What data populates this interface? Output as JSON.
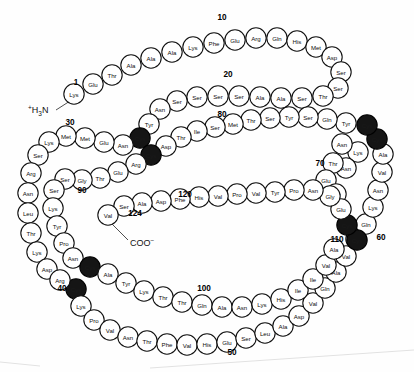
{
  "figure": {
    "type": "protein-sequence-diagram",
    "background_color": "#fefefe",
    "residue_fill": "#ffffff",
    "residue_stroke": "#111111",
    "cysteine_fill": "#151515",
    "n_terminus_label": "H3N",
    "n_terminus_superscript": "+",
    "n_terminus_subscript": "3",
    "c_terminus_label": "COO",
    "c_terminus_superscript": "-",
    "total_residues": 124
  },
  "number_markers": [
    {
      "n": "1",
      "x": 76,
      "y": 82
    },
    {
      "n": "10",
      "x": 222,
      "y": 17
    },
    {
      "n": "20",
      "x": 228,
      "y": 74
    },
    {
      "n": "30",
      "x": 70,
      "y": 122
    },
    {
      "n": "40",
      "x": 62,
      "y": 288
    },
    {
      "n": "50",
      "x": 232,
      "y": 352
    },
    {
      "n": "60",
      "x": 381,
      "y": 237
    },
    {
      "n": "70",
      "x": 320,
      "y": 163
    },
    {
      "n": "80",
      "x": 222,
      "y": 114
    },
    {
      "n": "90",
      "x": 82,
      "y": 190
    },
    {
      "n": "100",
      "x": 204,
      "y": 288
    },
    {
      "n": "110",
      "x": 337,
      "y": 239
    },
    {
      "n": "120",
      "x": 185,
      "y": 194
    },
    {
      "n": "124",
      "x": 135,
      "y": 213
    }
  ],
  "sequence": [
    {
      "i": 1,
      "aa": "Lys",
      "cys": false,
      "x": 74,
      "y": 94
    },
    {
      "i": 2,
      "aa": "Glu",
      "cys": false,
      "x": 93,
      "y": 84
    },
    {
      "i": 3,
      "aa": "Thr",
      "cys": false,
      "x": 112,
      "y": 75
    },
    {
      "i": 4,
      "aa": "Ala",
      "cys": false,
      "x": 131,
      "y": 65
    },
    {
      "i": 5,
      "aa": "Ala",
      "cys": false,
      "x": 151,
      "y": 58
    },
    {
      "i": 6,
      "aa": "Ala",
      "cys": false,
      "x": 172,
      "y": 52
    },
    {
      "i": 7,
      "aa": "Lys",
      "cys": false,
      "x": 193,
      "y": 47
    },
    {
      "i": 8,
      "aa": "Phe",
      "cys": false,
      "x": 214,
      "y": 43
    },
    {
      "i": 9,
      "aa": "Glu",
      "cys": false,
      "x": 235,
      "y": 40
    },
    {
      "i": 10,
      "aa": "Arg",
      "cys": false,
      "x": 256,
      "y": 38
    },
    {
      "i": 11,
      "aa": "Gln",
      "cys": false,
      "x": 277,
      "y": 38
    },
    {
      "i": 12,
      "aa": "His",
      "cys": false,
      "x": 297,
      "y": 41
    },
    {
      "i": 13,
      "aa": "Met",
      "cys": false,
      "x": 316,
      "y": 47
    },
    {
      "i": 14,
      "aa": "Asp",
      "cys": false,
      "x": 332,
      "y": 57
    },
    {
      "i": 15,
      "aa": "Ser",
      "cys": false,
      "x": 341,
      "y": 72
    },
    {
      "i": 16,
      "aa": "Ser",
      "cys": false,
      "x": 338,
      "y": 88
    },
    {
      "i": 17,
      "aa": "Thr",
      "cys": false,
      "x": 323,
      "y": 96
    },
    {
      "i": 18,
      "aa": "Ser",
      "cys": false,
      "x": 302,
      "y": 98
    },
    {
      "i": 19,
      "aa": "Ala",
      "cys": false,
      "x": 281,
      "y": 98
    },
    {
      "i": 20,
      "aa": "Ala",
      "cys": false,
      "x": 260,
      "y": 97
    },
    {
      "i": 21,
      "aa": "Ser",
      "cys": false,
      "x": 239,
      "y": 96
    },
    {
      "i": 22,
      "aa": "Ser",
      "cys": false,
      "x": 218,
      "y": 96
    },
    {
      "i": 23,
      "aa": "Ser",
      "cys": false,
      "x": 197,
      "y": 97
    },
    {
      "i": 24,
      "aa": "Ser",
      "cys": false,
      "x": 177,
      "y": 101
    },
    {
      "i": 25,
      "aa": "Asn",
      "cys": false,
      "x": 160,
      "y": 109
    },
    {
      "i": 26,
      "aa": "Tyr",
      "cys": false,
      "x": 149,
      "y": 124
    },
    {
      "i": 27,
      "aa": "Cys",
      "cys": true,
      "x": 140,
      "y": 138
    },
    {
      "i": 28,
      "aa": "Asn",
      "cys": false,
      "x": 123,
      "y": 145
    },
    {
      "i": 29,
      "aa": "Glu",
      "cys": false,
      "x": 104,
      "y": 142
    },
    {
      "i": 30,
      "aa": "Met",
      "cys": false,
      "x": 85,
      "y": 138
    },
    {
      "i": 31,
      "aa": "Met",
      "cys": false,
      "x": 66,
      "y": 136
    },
    {
      "i": 32,
      "aa": "Lys",
      "cys": false,
      "x": 49,
      "y": 142
    },
    {
      "i": 33,
      "aa": "Ser",
      "cys": false,
      "x": 38,
      "y": 155
    },
    {
      "i": 34,
      "aa": "Arg",
      "cys": false,
      "x": 31,
      "y": 173
    },
    {
      "i": 35,
      "aa": "Asn",
      "cys": false,
      "x": 28,
      "y": 193
    },
    {
      "i": 36,
      "aa": "Leu",
      "cys": false,
      "x": 28,
      "y": 213
    },
    {
      "i": 37,
      "aa": "Thr",
      "cys": false,
      "x": 31,
      "y": 233
    },
    {
      "i": 38,
      "aa": "Lys",
      "cys": false,
      "x": 37,
      "y": 252
    },
    {
      "i": 39,
      "aa": "Asp",
      "cys": false,
      "x": 47,
      "y": 269
    },
    {
      "i": 40,
      "aa": "Cys",
      "cys": true,
      "x": 76,
      "y": 289
    },
    {
      "i": 41,
      "aa": "Arg",
      "cys": false,
      "x": 60,
      "y": 280
    },
    {
      "i": 42,
      "aa": "Lys",
      "cys": false,
      "x": 81,
      "y": 306
    },
    {
      "i": 43,
      "aa": "Pro",
      "cys": false,
      "x": 94,
      "y": 320
    },
    {
      "i": 44,
      "aa": "Val",
      "cys": false,
      "x": 110,
      "y": 330
    },
    {
      "i": 45,
      "aa": "Asn",
      "cys": false,
      "x": 128,
      "y": 337
    },
    {
      "i": 46,
      "aa": "Thr",
      "cys": false,
      "x": 147,
      "y": 341
    },
    {
      "i": 47,
      "aa": "Phe",
      "cys": false,
      "x": 167,
      "y": 344
    },
    {
      "i": 48,
      "aa": "Val",
      "cys": false,
      "x": 187,
      "y": 345
    },
    {
      "i": 49,
      "aa": "His",
      "cys": false,
      "x": 207,
      "y": 344
    },
    {
      "i": 50,
      "aa": "Glu",
      "cys": false,
      "x": 227,
      "y": 342
    },
    {
      "i": 51,
      "aa": "Ser",
      "cys": false,
      "x": 246,
      "y": 338
    },
    {
      "i": 52,
      "aa": "Leu",
      "cys": false,
      "x": 265,
      "y": 333
    },
    {
      "i": 53,
      "aa": "Ala",
      "cys": false,
      "x": 283,
      "y": 326
    },
    {
      "i": 54,
      "aa": "Asp",
      "cys": false,
      "x": 299,
      "y": 316
    },
    {
      "i": 55,
      "aa": "Val",
      "cys": false,
      "x": 313,
      "y": 303
    },
    {
      "i": 56,
      "aa": "Gln",
      "cys": false,
      "x": 325,
      "y": 288
    },
    {
      "i": 57,
      "aa": "Ala",
      "cys": false,
      "x": 336,
      "y": 272
    },
    {
      "i": 58,
      "aa": "Val",
      "cys": false,
      "x": 346,
      "y": 256
    },
    {
      "i": 59,
      "aa": "Ser",
      "cys": false,
      "x": 356,
      "y": 239
    },
    {
      "i": 60,
      "aa": "Gln",
      "cys": false,
      "x": 366,
      "y": 224
    },
    {
      "i": 61,
      "aa": "Lys",
      "cys": false,
      "x": 373,
      "y": 207
    },
    {
      "i": 62,
      "aa": "Asn",
      "cys": false,
      "x": 378,
      "y": 190
    },
    {
      "i": 63,
      "aa": "Val",
      "cys": false,
      "x": 382,
      "y": 172
    },
    {
      "i": 64,
      "aa": "Ala",
      "cys": false,
      "x": 383,
      "y": 154
    },
    {
      "i": 65,
      "aa": "Cys",
      "cys": true,
      "x": 377,
      "y": 139
    },
    {
      "i": 66,
      "aa": "Cys",
      "cys": true,
      "x": 367,
      "y": 125
    },
    {
      "i": 67,
      "aa": "Lys",
      "cys": false,
      "x": 358,
      "y": 152
    },
    {
      "i": 68,
      "aa": "Asn",
      "cys": false,
      "x": 342,
      "y": 144
    },
    {
      "i": 69,
      "aa": "Asn",
      "cys": false,
      "x": 346,
      "y": 168
    },
    {
      "i": 70,
      "aa": "Thr",
      "cys": false,
      "x": 333,
      "y": 163
    },
    {
      "i": 71,
      "aa": "Glu",
      "cys": false,
      "x": 326,
      "y": 180
    },
    {
      "i": 72,
      "aa": "Gly",
      "cys": false,
      "x": 336,
      "y": 194
    },
    {
      "i": 73,
      "aa": "Tyr",
      "cys": false,
      "x": 346,
      "y": 123
    },
    {
      "i": 74,
      "aa": "Gln",
      "cys": false,
      "x": 327,
      "y": 119
    },
    {
      "i": 75,
      "aa": "Ser",
      "cys": false,
      "x": 308,
      "y": 117
    },
    {
      "i": 76,
      "aa": "Tyr",
      "cys": false,
      "x": 289,
      "y": 117
    },
    {
      "i": 77,
      "aa": "Ser",
      "cys": false,
      "x": 270,
      "y": 118
    },
    {
      "i": 78,
      "aa": "Thr",
      "cys": false,
      "x": 251,
      "y": 120
    },
    {
      "i": 79,
      "aa": "Met",
      "cys": false,
      "x": 233,
      "y": 124
    },
    {
      "i": 80,
      "aa": "Ser",
      "cys": false,
      "x": 215,
      "y": 127
    },
    {
      "i": 81,
      "aa": "Ile",
      "cys": false,
      "x": 197,
      "y": 131
    },
    {
      "i": 82,
      "aa": "Thr",
      "cys": false,
      "x": 181,
      "y": 137
    },
    {
      "i": 83,
      "aa": "Asp",
      "cys": false,
      "x": 166,
      "y": 146
    },
    {
      "i": 84,
      "aa": "Cys",
      "cys": true,
      "x": 151,
      "y": 155
    },
    {
      "i": 85,
      "aa": "Arg",
      "cys": false,
      "x": 136,
      "y": 164
    },
    {
      "i": 86,
      "aa": "Glu",
      "cys": false,
      "x": 118,
      "y": 172
    },
    {
      "i": 87,
      "aa": "Thr",
      "cys": false,
      "x": 100,
      "y": 178
    },
    {
      "i": 88,
      "aa": "Gly",
      "cys": false,
      "x": 82,
      "y": 180
    },
    {
      "i": 89,
      "aa": "Ser",
      "cys": false,
      "x": 65,
      "y": 179
    },
    {
      "i": 90,
      "aa": "Ser",
      "cys": false,
      "x": 54,
      "y": 190
    },
    {
      "i": 91,
      "aa": "Lys",
      "cys": false,
      "x": 53,
      "y": 208
    },
    {
      "i": 92,
      "aa": "Tyr",
      "cys": false,
      "x": 57,
      "y": 226
    },
    {
      "i": 93,
      "aa": "Pro",
      "cys": false,
      "x": 64,
      "y": 243
    },
    {
      "i": 94,
      "aa": "Asn",
      "cys": false,
      "x": 73,
      "y": 258
    },
    {
      "i": 95,
      "aa": "Cys",
      "cys": true,
      "x": 90,
      "y": 267
    },
    {
      "i": 96,
      "aa": "Ala",
      "cys": false,
      "x": 108,
      "y": 274
    },
    {
      "i": 97,
      "aa": "Tyr",
      "cys": false,
      "x": 126,
      "y": 283
    },
    {
      "i": 98,
      "aa": "Lys",
      "cys": false,
      "x": 144,
      "y": 291
    },
    {
      "i": 99,
      "aa": "Thr",
      "cys": false,
      "x": 163,
      "y": 297
    },
    {
      "i": 100,
      "aa": "Thr",
      "cys": false,
      "x": 182,
      "y": 302
    },
    {
      "i": 101,
      "aa": "Gln",
      "cys": false,
      "x": 202,
      "y": 305
    },
    {
      "i": 102,
      "aa": "Ala",
      "cys": false,
      "x": 222,
      "y": 307
    },
    {
      "i": 103,
      "aa": "Asn",
      "cys": false,
      "x": 242,
      "y": 307
    },
    {
      "i": 104,
      "aa": "Lys",
      "cys": false,
      "x": 262,
      "y": 304
    },
    {
      "i": 105,
      "aa": "His",
      "cys": false,
      "x": 281,
      "y": 299
    },
    {
      "i": 106,
      "aa": "Ile",
      "cys": false,
      "x": 298,
      "y": 290
    },
    {
      "i": 107,
      "aa": "Ile",
      "cys": false,
      "x": 313,
      "y": 279
    },
    {
      "i": 108,
      "aa": "Val",
      "cys": false,
      "x": 326,
      "y": 265
    },
    {
      "i": 109,
      "aa": "Ala",
      "cys": false,
      "x": 334,
      "y": 249
    },
    {
      "i": 110,
      "aa": "Cys",
      "cys": true,
      "x": 357,
      "y": 240
    },
    {
      "i": 111,
      "aa": "Cys",
      "cys": true,
      "x": 347,
      "y": 225
    },
    {
      "i": 112,
      "aa": "Glu",
      "cys": false,
      "x": 341,
      "y": 209
    },
    {
      "i": 113,
      "aa": "Gly",
      "cys": false,
      "x": 330,
      "y": 196
    },
    {
      "i": 114,
      "aa": "Asn",
      "cys": false,
      "x": 313,
      "y": 190
    },
    {
      "i": 115,
      "aa": "Pro",
      "cys": false,
      "x": 294,
      "y": 190
    },
    {
      "i": 116,
      "aa": "Tyr",
      "cys": false,
      "x": 275,
      "y": 192
    },
    {
      "i": 117,
      "aa": "Val",
      "cys": false,
      "x": 256,
      "y": 193
    },
    {
      "i": 118,
      "aa": "Pro",
      "cys": false,
      "x": 237,
      "y": 194
    },
    {
      "i": 119,
      "aa": "Val",
      "cys": false,
      "x": 218,
      "y": 196
    },
    {
      "i": 120,
      "aa": "His",
      "cys": false,
      "x": 199,
      "y": 197
    },
    {
      "i": 121,
      "aa": "Phe",
      "cys": false,
      "x": 180,
      "y": 199
    },
    {
      "i": 122,
      "aa": "Asp",
      "cys": false,
      "x": 161,
      "y": 201
    },
    {
      "i": 123,
      "aa": "Ala",
      "cys": false,
      "x": 142,
      "y": 203
    },
    {
      "i": 124,
      "aa": "Ser",
      "cys": false,
      "x": 124,
      "y": 206
    },
    {
      "i": 125,
      "aa": "Val",
      "cys": false,
      "x": 108,
      "y": 215
    }
  ]
}
